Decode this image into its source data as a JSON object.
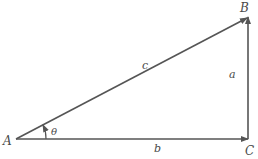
{
  "diagram": {
    "type": "right-triangle",
    "vertices": {
      "A": {
        "label": "A"
      },
      "B": {
        "label": "B"
      },
      "C": {
        "label": "C"
      }
    },
    "sides": {
      "a": {
        "label": "a",
        "from": "C",
        "to": "B"
      },
      "b": {
        "label": "b",
        "from": "A",
        "to": "C"
      },
      "c": {
        "label": "c",
        "from": "A",
        "to": "B"
      }
    },
    "angle": {
      "label": "θ",
      "at": "A"
    },
    "colors": {
      "line": "#555555",
      "text": "#4a4a4a"
    }
  }
}
